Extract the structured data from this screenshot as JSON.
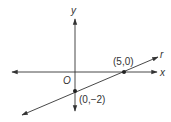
{
  "diagram": {
    "type": "coordinate-plane",
    "axes": {
      "x_label": "x",
      "y_label": "y",
      "origin_label": "O"
    },
    "line": {
      "name": "r",
      "points": [
        {
          "label": "(5,0)",
          "x": 5,
          "y": 0
        },
        {
          "label": "(0,−2)",
          "x": 0,
          "y": -2
        }
      ]
    },
    "colors": {
      "stroke": "#333333",
      "background": "#ffffff"
    }
  }
}
